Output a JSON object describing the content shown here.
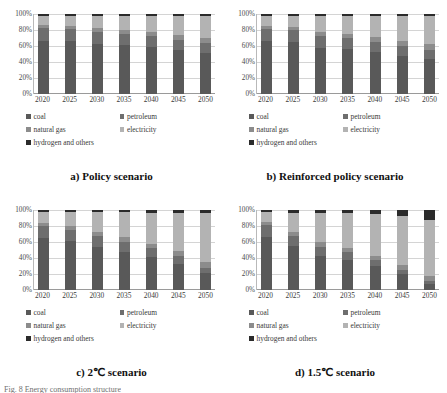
{
  "figure": {
    "caption": "Fig. 8 Energy consumption structure"
  },
  "legend": {
    "items": [
      {
        "label": "coal",
        "color": "#595959"
      },
      {
        "label": "petroleum",
        "color": "#6e6e6e"
      },
      {
        "label": "natural gas",
        "color": "#8c8c8c"
      },
      {
        "label": "electricity",
        "color": "#b3b3b3"
      },
      {
        "label": "hydrogen and others",
        "color": "#2b2b2b"
      }
    ]
  },
  "axis": {
    "yticks": [
      "100%",
      "80%",
      "60%",
      "40%",
      "20%",
      "0%"
    ],
    "ytick_values": [
      100,
      80,
      60,
      40,
      20,
      0
    ],
    "xticks": [
      "2020",
      "2025",
      "2030",
      "2035",
      "2040",
      "2045",
      "2050"
    ]
  },
  "chart_data": [
    {
      "type": "bar",
      "id": "policy",
      "title": "a) Policy scenario",
      "stacked": true,
      "normalized_percent": true,
      "categories": [
        "2020",
        "2025",
        "2030",
        "2035",
        "2040",
        "2045",
        "2050"
      ],
      "xlabel": "",
      "ylabel": "",
      "ylim": [
        0,
        100
      ],
      "grid": true,
      "legend_position": "below",
      "series": [
        {
          "name": "coal",
          "color": "#595959",
          "values": [
            66,
            66,
            63,
            61,
            59,
            55,
            51
          ]
        },
        {
          "name": "petroleum",
          "color": "#6e6e6e",
          "values": [
            16,
            15,
            15,
            14,
            14,
            13,
            13
          ]
        },
        {
          "name": "natural gas",
          "color": "#8c8c8c",
          "values": [
            4,
            4,
            5,
            5,
            5,
            6,
            6
          ]
        },
        {
          "name": "electricity",
          "color": "#b3b3b3",
          "values": [
            12,
            13,
            15,
            18,
            20,
            24,
            28
          ]
        },
        {
          "name": "hydrogen and others",
          "color": "#2b2b2b",
          "values": [
            2,
            2,
            2,
            2,
            2,
            2,
            2
          ]
        }
      ]
    },
    {
      "type": "bar",
      "id": "reinforced-policy",
      "title": "b) Reinforced policy scenario",
      "stacked": true,
      "normalized_percent": true,
      "categories": [
        "2020",
        "2025",
        "2030",
        "2035",
        "2040",
        "2045",
        "2050"
      ],
      "xlabel": "",
      "ylabel": "",
      "ylim": [
        0,
        100
      ],
      "grid": true,
      "legend_position": "below",
      "series": [
        {
          "name": "coal",
          "color": "#595959",
          "values": [
            66,
            65,
            58,
            56,
            52,
            48,
            44
          ]
        },
        {
          "name": "petroleum",
          "color": "#6e6e6e",
          "values": [
            15,
            15,
            15,
            14,
            13,
            12,
            11
          ]
        },
        {
          "name": "natural gas",
          "color": "#8c8c8c",
          "values": [
            4,
            4,
            5,
            5,
            6,
            6,
            7
          ]
        },
        {
          "name": "electricity",
          "color": "#b3b3b3",
          "values": [
            13,
            14,
            20,
            23,
            27,
            31,
            35
          ]
        },
        {
          "name": "hydrogen and others",
          "color": "#2b2b2b",
          "values": [
            2,
            2,
            2,
            2,
            2,
            3,
            3
          ]
        }
      ]
    },
    {
      "type": "bar",
      "id": "two-degree",
      "title": "c) 2℃ scenario",
      "stacked": true,
      "normalized_percent": true,
      "categories": [
        "2020",
        "2025",
        "2030",
        "2035",
        "2040",
        "2045",
        "2050"
      ],
      "xlabel": "",
      "ylabel": "",
      "ylim": [
        0,
        100
      ],
      "grid": true,
      "legend_position": "below",
      "series": [
        {
          "name": "coal",
          "color": "#595959",
          "values": [
            65,
            61,
            54,
            48,
            41,
            33,
            21
          ]
        },
        {
          "name": "petroleum",
          "color": "#6e6e6e",
          "values": [
            15,
            14,
            13,
            12,
            11,
            9,
            7
          ]
        },
        {
          "name": "natural gas",
          "color": "#8c8c8c",
          "values": [
            4,
            5,
            5,
            6,
            6,
            7,
            7
          ]
        },
        {
          "name": "electricity",
          "color": "#b3b3b3",
          "values": [
            13,
            17,
            25,
            31,
            38,
            47,
            61
          ]
        },
        {
          "name": "hydrogen and others",
          "color": "#2b2b2b",
          "values": [
            3,
            3,
            3,
            3,
            4,
            4,
            4
          ]
        }
      ]
    },
    {
      "type": "bar",
      "id": "one-point-five-degree",
      "title": "d) 1.5℃ scenario",
      "stacked": true,
      "normalized_percent": true,
      "categories": [
        "2020",
        "2025",
        "2030",
        "2035",
        "2040",
        "2045",
        "2050"
      ],
      "xlabel": "",
      "ylabel": "",
      "ylim": [
        0,
        100
      ],
      "grid": true,
      "legend_position": "below",
      "series": [
        {
          "name": "coal",
          "color": "#595959",
          "values": [
            66,
            55,
            43,
            38,
            30,
            20,
            8
          ]
        },
        {
          "name": "petroleum",
          "color": "#6e6e6e",
          "values": [
            15,
            13,
            11,
            9,
            7,
            5,
            3
          ]
        },
        {
          "name": "natural gas",
          "color": "#8c8c8c",
          "values": [
            4,
            5,
            6,
            6,
            6,
            6,
            6
          ]
        },
        {
          "name": "electricity",
          "color": "#b3b3b3",
          "values": [
            12,
            23,
            36,
            43,
            52,
            62,
            71
          ]
        },
        {
          "name": "hydrogen and others",
          "color": "#2b2b2b",
          "values": [
            3,
            4,
            4,
            4,
            5,
            7,
            12
          ]
        }
      ]
    }
  ]
}
